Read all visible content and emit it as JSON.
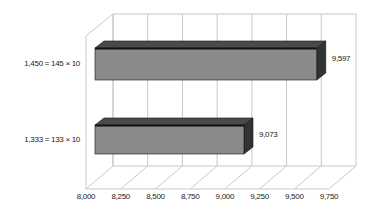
{
  "chart_data": {
    "type": "bar",
    "orientation": "horizontal",
    "style": "3d",
    "title": "",
    "xlabel": "",
    "ylabel": "",
    "categories": [
      "1,333 = 133 × 10",
      "1,450 = 145 × 10"
    ],
    "values": [
      9073,
      9597
    ],
    "value_labels": [
      "9,073",
      "9,597"
    ],
    "xlim": [
      8000,
      9750
    ],
    "x_ticks": [
      8000,
      8250,
      8500,
      8750,
      9000,
      9250,
      9500,
      9750
    ],
    "x_tick_labels": [
      "8,000",
      "8,250",
      "8,500",
      "8,750",
      "9,000",
      "9,250",
      "9,500",
      "9,750"
    ],
    "grid": true,
    "legend": "none",
    "colors": {
      "bar_front": "#8a8a8a",
      "bar_top": "#4a4a4a",
      "bar_side": "#333333",
      "grid": "#c8c8c8",
      "text": "#222222"
    }
  }
}
